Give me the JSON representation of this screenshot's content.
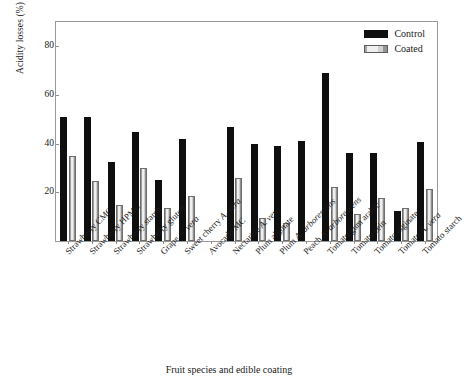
{
  "chart_data": {
    "type": "bar",
    "title": "",
    "xlabel": "Fruit species and edible coating",
    "ylabel": "Acidity losses (%)",
    "ylim": [
      0,
      90
    ],
    "yticks": [
      20,
      40,
      60,
      80
    ],
    "grid": false,
    "legend_position": "top-right",
    "categories": [
      "Strawberry CMC",
      "Strawberry HPMC",
      "Strawberry starch",
      "Strawberry gluten",
      "Grape A. vera",
      "Sweet cherry A. vera",
      "Avocado MC",
      "Nectarine A. vera",
      "Plum alginate",
      "Plum A. arborescens",
      "Peach A. arborescens",
      "Tomato gum arabic",
      "Tomato zein",
      "Tomato alginate",
      "Tomato A. vera",
      "Tomato starch"
    ],
    "series": [
      {
        "name": "Control",
        "color": "#100f10",
        "values": [
          51,
          51,
          32.5,
          45,
          25,
          42,
          0,
          47,
          40,
          39,
          41,
          69,
          36,
          36,
          12.5,
          40.5
        ]
      },
      {
        "name": "Coated",
        "color": "#efefef",
        "values": [
          35,
          24.5,
          15,
          30,
          13.5,
          18.5,
          0,
          26,
          9.5,
          7.5,
          0,
          22,
          11,
          17.5,
          13.5,
          21.5
        ]
      }
    ]
  },
  "legend": {
    "items": [
      {
        "label": "Control"
      },
      {
        "label": "Coated"
      }
    ]
  }
}
